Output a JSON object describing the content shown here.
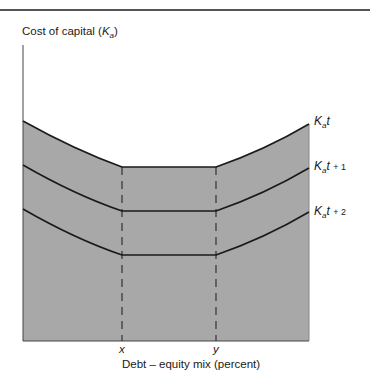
{
  "diagram": {
    "y_axis_label": "Cost of capital",
    "y_axis_symbol": "K",
    "y_axis_symbol_sub": "a",
    "x_axis_label": "Debt – equity mix (percent)",
    "x_ticks": [
      {
        "label": "x"
      },
      {
        "label": "y"
      }
    ],
    "curves": [
      {
        "name": "K",
        "sub": "a",
        "t": "t",
        "suffix": ""
      },
      {
        "name": "K",
        "sub": "a",
        "t": "t",
        "suffix": "+ 1"
      },
      {
        "name": "K",
        "sub": "a",
        "t": "t",
        "suffix": "+ 2"
      }
    ],
    "colors": {
      "shade": "#a8a8a8",
      "line": "#1a1a1a",
      "rule": "#555555"
    }
  }
}
